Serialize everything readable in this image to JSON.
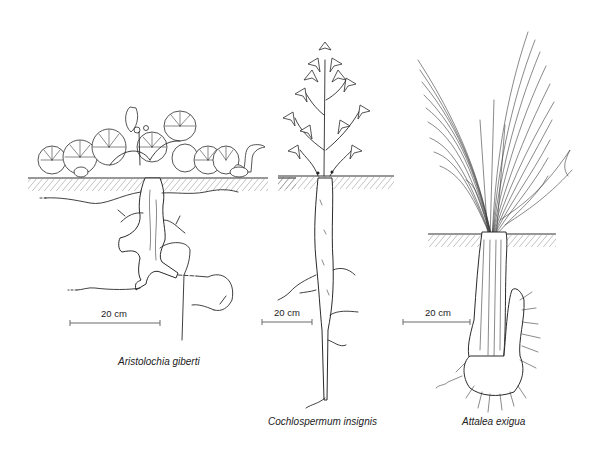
{
  "figure": {
    "plants": [
      {
        "id": "aristolochia",
        "species_name": "Aristolochia giberti",
        "scale_label": "20 cm",
        "organ": "lobed woody tuber with spreading lateral roots"
      },
      {
        "id": "cochlospermum",
        "species_name": "Cochlospermum insignis",
        "scale_label": "20 cm",
        "organ": "long tapering taproot"
      },
      {
        "id": "attalea",
        "species_name": "Attalea exigua",
        "scale_label": "20 cm",
        "organ": "bulbous subterranean stem base with fibrous roots"
      }
    ],
    "colors": {
      "ink": "#2a2a2a",
      "scale_bar": "#6a6a6a",
      "background": "#ffffff"
    }
  }
}
